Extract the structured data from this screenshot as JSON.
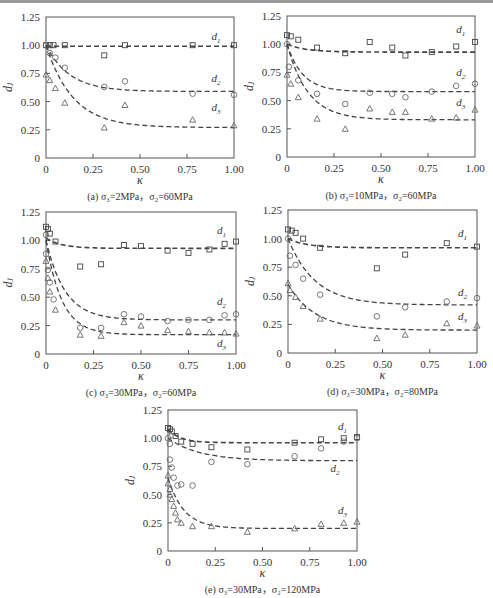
{
  "figure": {
    "width": 493,
    "height": 598
  },
  "chart_data": [
    {
      "id": "a",
      "type": "scatter",
      "caption": "(a) σ₃=2MPa，σ₂=60MPa",
      "xlabel": "κ",
      "ylabel": "dⱼ",
      "xlim": [
        0,
        1.0
      ],
      "ylim": [
        0,
        1.25
      ],
      "xticks": [
        "0",
        "0.25",
        "0.50",
        "0.75",
        "1.00"
      ],
      "yticks": [
        "0",
        "0.25",
        "0.50",
        "0.75",
        "1.00",
        "1.25"
      ],
      "frame": {
        "left": 46,
        "right": 234,
        "top": 17,
        "bottom": 158
      },
      "series": [
        {
          "name": "d1",
          "marker": "square",
          "label_pos": [
            0.88,
            1.05
          ],
          "points": [
            [
              0.0,
              1.0
            ],
            [
              0.02,
              1.0
            ],
            [
              0.04,
              1.0
            ],
            [
              0.1,
              1.0
            ],
            [
              0.31,
              0.91
            ],
            [
              0.42,
              1.0
            ],
            [
              0.78,
              1.0
            ],
            [
              1.0,
              1.0
            ]
          ],
          "fit": {
            "a": 0.99,
            "b": 0.0,
            "k": 10
          }
        },
        {
          "name": "d2",
          "marker": "circle",
          "label_pos": [
            0.88,
            0.67
          ],
          "points": [
            [
              0.0,
              1.0
            ],
            [
              0.02,
              0.93
            ],
            [
              0.05,
              0.89
            ],
            [
              0.1,
              0.8
            ],
            [
              0.31,
              0.63
            ],
            [
              0.42,
              0.68
            ],
            [
              0.78,
              0.57
            ],
            [
              1.0,
              0.56
            ]
          ],
          "fit": {
            "a": 0.59,
            "b": 0.41,
            "k": 8
          }
        },
        {
          "name": "d3",
          "marker": "triangle",
          "label_pos": [
            0.88,
            0.42
          ],
          "points": [
            [
              0.0,
              0.74
            ],
            [
              0.02,
              0.69
            ],
            [
              0.05,
              0.62
            ],
            [
              0.1,
              0.49
            ],
            [
              0.31,
              0.27
            ],
            [
              0.42,
              0.47
            ],
            [
              0.78,
              0.34
            ],
            [
              1.0,
              0.29
            ]
          ],
          "fit": {
            "a": 0.27,
            "b": 0.73,
            "k": 7
          }
        }
      ]
    },
    {
      "id": "b",
      "type": "scatter",
      "caption": "(b) σ₃=10MPa，σ₂=60MPa",
      "xlabel": "κ",
      "ylabel": "dⱼ",
      "xlim": [
        0,
        1.0
      ],
      "ylim": [
        0,
        1.25
      ],
      "xticks": [
        "0",
        "0.25",
        "0.50",
        "0.75",
        "1.00"
      ],
      "yticks": [
        "0",
        "0.25",
        "0.50",
        "0.75",
        "1.00",
        "1.25"
      ],
      "frame": {
        "left": 287,
        "right": 475,
        "top": 16,
        "bottom": 157
      },
      "series": [
        {
          "name": "d1",
          "marker": "square",
          "label_pos": [
            0.9,
            1.1
          ],
          "points": [
            [
              0.0,
              1.08
            ],
            [
              0.02,
              1.07
            ],
            [
              0.06,
              1.04
            ],
            [
              0.16,
              0.97
            ],
            [
              0.31,
              0.92
            ],
            [
              0.44,
              1.02
            ],
            [
              0.56,
              0.97
            ],
            [
              0.63,
              0.9
            ],
            [
              0.77,
              0.93
            ],
            [
              0.9,
              0.98
            ],
            [
              1.0,
              1.02
            ]
          ],
          "fit": {
            "a": 0.93,
            "b": 0.07,
            "k": 10
          }
        },
        {
          "name": "d2",
          "marker": "circle",
          "label_pos": [
            0.9,
            0.72
          ],
          "points": [
            [
              0.0,
              1.0
            ],
            [
              0.01,
              0.8
            ],
            [
              0.06,
              0.68
            ],
            [
              0.16,
              0.56
            ],
            [
              0.31,
              0.47
            ],
            [
              0.44,
              0.57
            ],
            [
              0.56,
              0.56
            ],
            [
              0.63,
              0.53
            ],
            [
              0.77,
              0.58
            ],
            [
              0.9,
              0.63
            ],
            [
              1.0,
              0.65
            ]
          ],
          "fit": {
            "a": 0.58,
            "b": 0.42,
            "k": 12
          }
        },
        {
          "name": "d3",
          "marker": "triangle",
          "label_pos": [
            0.9,
            0.45
          ],
          "points": [
            [
              0.0,
              0.73
            ],
            [
              0.02,
              0.65
            ],
            [
              0.06,
              0.53
            ],
            [
              0.16,
              0.34
            ],
            [
              0.31,
              0.25
            ],
            [
              0.44,
              0.43
            ],
            [
              0.56,
              0.4
            ],
            [
              0.63,
              0.4
            ],
            [
              0.77,
              0.34
            ],
            [
              0.9,
              0.35
            ],
            [
              1.0,
              0.42
            ]
          ],
          "fit": {
            "a": 0.33,
            "b": 0.67,
            "k": 9
          }
        }
      ]
    },
    {
      "id": "c",
      "type": "scatter",
      "caption": "(c) σ₃=30MPa，σ₂=60MPa",
      "xlabel": "κ",
      "ylabel": "dⱼ",
      "xlim": [
        0,
        1.0
      ],
      "ylim": [
        0,
        1.25
      ],
      "xticks": [
        "0",
        "0.25",
        "0.50",
        "0.75",
        "1.00"
      ],
      "yticks": [
        "0",
        "0.25",
        "0.50",
        "0.75",
        "1.00",
        "1.25"
      ],
      "frame": {
        "left": 46,
        "right": 236,
        "top": 212,
        "bottom": 354
      },
      "series": [
        {
          "name": "d1",
          "marker": "square",
          "label_pos": [
            0.9,
            1.06
          ],
          "points": [
            [
              0.0,
              1.12
            ],
            [
              0.01,
              1.1
            ],
            [
              0.02,
              1.06
            ],
            [
              0.05,
              0.99
            ],
            [
              0.18,
              0.77
            ],
            [
              0.29,
              0.79
            ],
            [
              0.41,
              0.96
            ],
            [
              0.5,
              0.95
            ],
            [
              0.64,
              0.91
            ],
            [
              0.75,
              0.89
            ],
            [
              0.86,
              0.92
            ],
            [
              0.94,
              0.97
            ],
            [
              1.0,
              0.99
            ]
          ],
          "fit": {
            "a": 0.93,
            "b": 0.09,
            "k": 12
          }
        },
        {
          "name": "d2",
          "marker": "circle",
          "label_pos": [
            0.9,
            0.43
          ],
          "points": [
            [
              0.0,
              1.05
            ],
            [
              0.0,
              0.88
            ],
            [
              0.01,
              0.74
            ],
            [
              0.02,
              0.63
            ],
            [
              0.04,
              0.48
            ],
            [
              0.18,
              0.23
            ],
            [
              0.29,
              0.23
            ],
            [
              0.41,
              0.35
            ],
            [
              0.5,
              0.33
            ],
            [
              0.64,
              0.29
            ],
            [
              0.75,
              0.3
            ],
            [
              0.86,
              0.3
            ],
            [
              0.94,
              0.34
            ],
            [
              1.0,
              0.35
            ]
          ],
          "fit": {
            "a": 0.3,
            "b": 0.7,
            "k": 10
          }
        },
        {
          "name": "d3",
          "marker": "triangle",
          "label_pos": [
            0.9,
            0.06
          ],
          "points": [
            [
              0.0,
              0.82
            ],
            [
              0.01,
              0.67
            ],
            [
              0.02,
              0.55
            ],
            [
              0.05,
              0.39
            ],
            [
              0.18,
              0.17
            ],
            [
              0.29,
              0.16
            ],
            [
              0.41,
              0.28
            ],
            [
              0.5,
              0.25
            ],
            [
              0.64,
              0.21
            ],
            [
              0.75,
              0.2
            ],
            [
              0.86,
              0.19
            ],
            [
              0.94,
              0.19
            ],
            [
              1.0,
              0.18
            ]
          ],
          "fit": {
            "a": 0.17,
            "b": 0.83,
            "k": 12
          }
        }
      ]
    },
    {
      "id": "d",
      "type": "scatter",
      "caption": "(d) σ₃=30MPa，σ₂=80MPa",
      "xlabel": "κ",
      "ylabel": "dⱼ",
      "xlim": [
        0,
        1.0
      ],
      "ylim": [
        0,
        1.25
      ],
      "xticks": [
        "0",
        "0.25",
        "0.50",
        "0.75",
        "1.00"
      ],
      "yticks": [
        "0",
        "0.25",
        "0.50",
        "0.75",
        "1.00",
        "1.25"
      ],
      "frame": {
        "left": 288,
        "right": 477,
        "top": 210,
        "bottom": 353
      },
      "series": [
        {
          "name": "d1",
          "marker": "square",
          "label_pos": [
            0.9,
            1.01
          ],
          "points": [
            [
              0.0,
              1.08
            ],
            [
              0.02,
              1.07
            ],
            [
              0.04,
              1.05
            ],
            [
              0.08,
              1.0
            ],
            [
              0.17,
              0.92
            ],
            [
              0.47,
              0.74
            ],
            [
              0.62,
              0.86
            ],
            [
              0.84,
              0.96
            ],
            [
              1.0,
              0.93
            ]
          ],
          "fit": {
            "a": 0.92,
            "b": 0.08,
            "k": 10
          }
        },
        {
          "name": "d2",
          "marker": "circle",
          "label_pos": [
            0.9,
            0.5
          ],
          "points": [
            [
              0.0,
              1.0
            ],
            [
              0.01,
              0.85
            ],
            [
              0.04,
              0.77
            ],
            [
              0.08,
              0.65
            ],
            [
              0.17,
              0.51
            ],
            [
              0.47,
              0.32
            ],
            [
              0.62,
              0.4
            ],
            [
              0.84,
              0.45
            ],
            [
              1.0,
              0.48
            ]
          ],
          "fit": {
            "a": 0.42,
            "b": 0.58,
            "k": 7
          }
        },
        {
          "name": "d3",
          "marker": "triangle",
          "label_pos": [
            0.9,
            0.29
          ],
          "points": [
            [
              0.0,
              0.61
            ],
            [
              0.01,
              0.55
            ],
            [
              0.04,
              0.49
            ],
            [
              0.08,
              0.41
            ],
            [
              0.17,
              0.3
            ],
            [
              0.47,
              0.13
            ],
            [
              0.62,
              0.16
            ],
            [
              0.84,
              0.26
            ],
            [
              1.0,
              0.24
            ]
          ],
          "fit": {
            "a": 0.2,
            "b": 0.4,
            "k": 7
          }
        }
      ]
    },
    {
      "id": "e",
      "type": "scatter",
      "caption": "(e) σ₃=30MPa，σ₂=120MPa",
      "xlabel": "κ",
      "ylabel": "dⱼ",
      "xlim": [
        0,
        1.0
      ],
      "ylim": [
        0,
        1.25
      ],
      "xticks": [
        "0",
        "0.25",
        "0.50",
        "0.75",
        "1.00"
      ],
      "yticks": [
        "0",
        "0.25",
        "0.50",
        "0.75",
        "1.00",
        "1.25"
      ],
      "frame": {
        "left": 168,
        "right": 357,
        "top": 410,
        "bottom": 551
      },
      "series": [
        {
          "name": "d1",
          "marker": "square",
          "label_pos": [
            0.9,
            1.07
          ],
          "points": [
            [
              0.0,
              1.09
            ],
            [
              0.01,
              1.08
            ],
            [
              0.02,
              1.06
            ],
            [
              0.04,
              1.02
            ],
            [
              0.07,
              0.97
            ],
            [
              0.13,
              0.95
            ],
            [
              0.23,
              0.92
            ],
            [
              0.42,
              0.9
            ],
            [
              0.67,
              0.96
            ],
            [
              0.81,
              0.99
            ],
            [
              0.93,
              1.0
            ],
            [
              1.0,
              1.01
            ]
          ],
          "fit": {
            "a": 0.96,
            "b": 0.12,
            "k": 15
          }
        },
        {
          "name": "d2",
          "marker": "circle",
          "label_pos": [
            0.86,
            0.7
          ],
          "points": [
            [
              0.0,
              1.0
            ],
            [
              0.01,
              0.95
            ],
            [
              0.01,
              0.81
            ],
            [
              0.02,
              0.74
            ],
            [
              0.03,
              0.65
            ],
            [
              0.05,
              0.58
            ],
            [
              0.07,
              0.59
            ],
            [
              0.13,
              0.58
            ],
            [
              0.23,
              0.79
            ],
            [
              0.42,
              0.77
            ],
            [
              0.67,
              0.84
            ],
            [
              0.81,
              0.91
            ],
            [
              0.93,
              0.97
            ],
            [
              1.0,
              1.0
            ]
          ],
          "fit": {
            "a": 0.8,
            "b": 0.2,
            "k": 6
          }
        },
        {
          "name": "d3",
          "marker": "triangle",
          "label_pos": [
            0.9,
            0.33
          ],
          "points": [
            [
              0.0,
              0.67
            ],
            [
              0.0,
              0.6
            ],
            [
              0.01,
              0.55
            ],
            [
              0.01,
              0.5
            ],
            [
              0.02,
              0.46
            ],
            [
              0.03,
              0.4
            ],
            [
              0.04,
              0.34
            ],
            [
              0.05,
              0.28
            ],
            [
              0.07,
              0.25
            ],
            [
              0.13,
              0.22
            ],
            [
              0.23,
              0.22
            ],
            [
              0.42,
              0.17
            ],
            [
              0.67,
              0.2
            ],
            [
              0.81,
              0.24
            ],
            [
              0.93,
              0.25
            ],
            [
              1.0,
              0.26
            ]
          ],
          "fit": {
            "a": 0.2,
            "b": 0.45,
            "k": 12
          }
        }
      ]
    }
  ]
}
